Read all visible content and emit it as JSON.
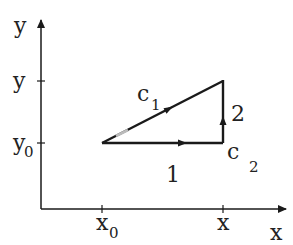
{
  "diagram": {
    "axes": {
      "x_label": "x",
      "y_label": "y",
      "x_ticks": [
        {
          "main": "x",
          "sub": "0"
        },
        {
          "main": "x",
          "sub": ""
        }
      ],
      "y_ticks": [
        {
          "main": "y",
          "sub": ""
        },
        {
          "main": "y",
          "sub": "0"
        }
      ]
    },
    "paths": {
      "c1": {
        "main": "c",
        "sub": "1"
      },
      "c2": {
        "main": "c",
        "sub": "2"
      },
      "segment_1": "1",
      "segment_2": "2"
    },
    "colors": {
      "stroke": "#1a1a1a",
      "dash_highlight": "#bbbbbb"
    }
  }
}
